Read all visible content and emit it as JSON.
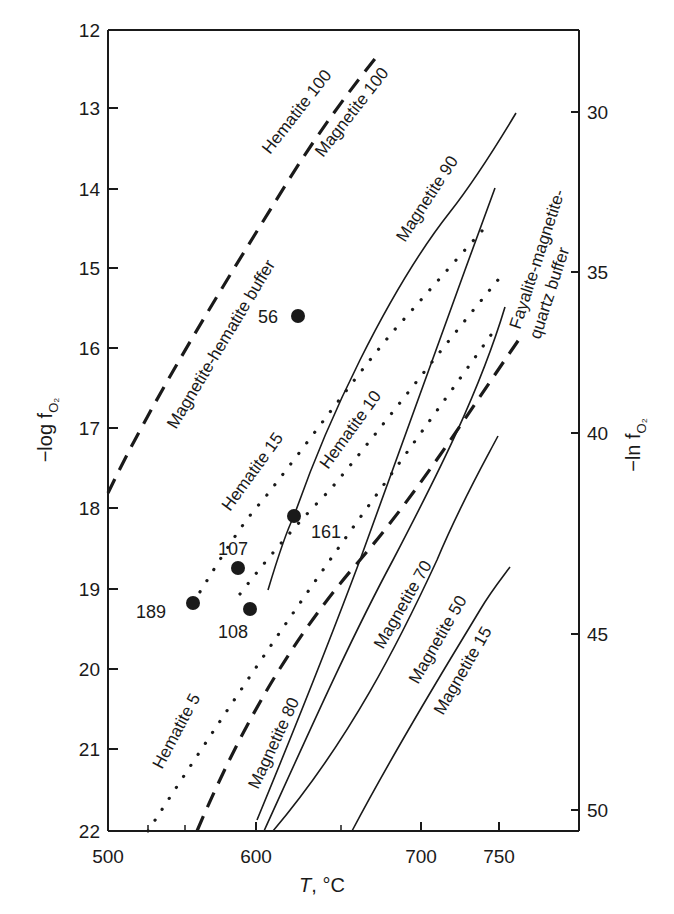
{
  "chart_data": {
    "type": "line",
    "title": "",
    "xlabel": "T, °C",
    "ylabel": "−log fO2",
    "ylabel_right": "−ln fO2",
    "xlim": [
      500,
      800
    ],
    "ylim": [
      22,
      12
    ],
    "x_ticks": [
      500,
      600,
      700,
      750
    ],
    "y_ticks": [
      12,
      13,
      14,
      15,
      16,
      17,
      18,
      19,
      20,
      21,
      22
    ],
    "y_right_ticks": [
      30,
      35,
      40,
      45,
      50
    ],
    "grid": false,
    "legend": "none (curves labelled inline)",
    "series": [
      {
        "name": "Magnetite-hematite buffer",
        "style": "dashed",
        "x": [
          500,
          530,
          570,
          610,
          660
        ],
        "y": [
          17.8,
          16.6,
          15.3,
          13.8,
          12.3
        ]
      },
      {
        "name": "Hematite 100 / Magnetite 100",
        "style": "label",
        "note": "labels on either side of magnetite-hematite buffer"
      },
      {
        "name": "Fayalite-magnetite-quartz buffer",
        "style": "dashed",
        "x": [
          565,
          620,
          680,
          758
        ],
        "y": [
          22.0,
          19.6,
          17.8,
          16.0
        ]
      },
      {
        "name": "Hematite 5",
        "style": "dotted",
        "x": [
          530,
          625,
          715,
          750
        ],
        "y": [
          22.0,
          19.2,
          16.7,
          15.7
        ]
      },
      {
        "name": "Hematite 10",
        "style": "dotted",
        "x": [
          595,
          650,
          715,
          750
        ],
        "y": [
          19.1,
          17.7,
          16.0,
          15.1
        ]
      },
      {
        "name": "Hematite 15",
        "style": "dotted",
        "x": [
          553,
          600,
          690,
          745
        ],
        "y": [
          19.2,
          17.9,
          15.5,
          14.3
        ]
      },
      {
        "name": "Magnetite 90",
        "style": "solid",
        "x": [
          610,
          625,
          680,
          720,
          762
        ],
        "y": [
          19.0,
          18.1,
          15.8,
          14.4,
          13.0
        ]
      },
      {
        "name": "Magnetite 80",
        "style": "solid",
        "x": [
          600,
          665,
          710,
          748
        ],
        "y": [
          21.9,
          18.7,
          16.8,
          14.0
        ]
      },
      {
        "name": "Magnetite 70",
        "style": "solid",
        "x": [
          605,
          685,
          755
        ],
        "y": [
          22.0,
          18.7,
          15.5
        ]
      },
      {
        "name": "Magnetite 50",
        "style": "solid",
        "x": [
          612,
          710,
          750
        ],
        "y": [
          22.0,
          18.7,
          17.1
        ]
      },
      {
        "name": "Magnetite 15",
        "style": "solid",
        "x": [
          655,
          745,
          757
        ],
        "y": [
          22.0,
          19.0,
          18.7
        ]
      }
    ],
    "points": [
      {
        "label": "56",
        "T": 640,
        "neg_log_fO2": 16.3
      },
      {
        "label": "161",
        "T": 625,
        "neg_log_fO2": 18.1
      },
      {
        "label": "107",
        "T": 588,
        "neg_log_fO2": 18.75
      },
      {
        "label": "189",
        "T": 556,
        "neg_log_fO2": 19.2
      },
      {
        "label": "108",
        "T": 596,
        "neg_log_fO2": 19.25
      }
    ]
  },
  "figure": {
    "plot": {
      "left": 108,
      "right": 579,
      "top": 30,
      "bottom": 831
    },
    "x_tick_px": [
      {
        "v": "500",
        "x": 108
      },
      {
        "v": "600",
        "x": 256
      },
      {
        "v": "700",
        "x": 421
      },
      {
        "v": "750",
        "x": 499
      }
    ],
    "x_minor_px": [
      148,
      185,
      341
    ],
    "y_tick_px": [
      {
        "v": "12",
        "y": 30
      },
      {
        "v": "13",
        "y": 108
      },
      {
        "v": "14",
        "y": 189
      },
      {
        "v": "15",
        "y": 268
      },
      {
        "v": "16",
        "y": 348
      },
      {
        "v": "17",
        "y": 428
      },
      {
        "v": "18",
        "y": 508
      },
      {
        "v": "19",
        "y": 589
      },
      {
        "v": "20",
        "y": 669
      },
      {
        "v": "21",
        "y": 749
      },
      {
        "v": "22",
        "y": 831
      }
    ],
    "yr_tick_px": [
      {
        "v": "30",
        "y": 112
      },
      {
        "v": "35",
        "y": 272
      },
      {
        "v": "40",
        "y": 433
      },
      {
        "v": "45",
        "y": 634
      },
      {
        "v": "50",
        "y": 810
      }
    ],
    "curves": [
      {
        "id": "mh-buffer",
        "style": "dashed",
        "d": "M108,493 C150,405 220,290 290,178 C320,130 350,90 378,55"
      },
      {
        "id": "fmq-buffer",
        "style": "dashed",
        "d": "M197,831 C240,730 290,640 360,560 C420,490 470,410 520,338"
      },
      {
        "id": "hem5",
        "style": "dotted",
        "d": "M148,831 C220,720 300,600 380,490 C430,420 470,365 498,325"
      },
      {
        "id": "hem10",
        "style": "dotted",
        "d": "M240,594 C270,555 300,520 330,490 C380,430 440,350 498,280"
      },
      {
        "id": "hem15",
        "style": "dotted",
        "d": "M193,603 C220,560 240,525 263,500 C310,440 360,370 397,327 C430,290 460,255 490,222"
      },
      {
        "id": "mag90",
        "style": "solid",
        "d": "M268,590 C280,550 287,530 294,516 C310,470 330,420 360,360 C390,300 420,250 450,212 C475,180 495,148 516,113"
      },
      {
        "id": "mag80",
        "style": "solid",
        "d": "M257,820 C290,740 330,640 360,560 C400,450 440,340 465,270 C478,235 487,210 495,188"
      },
      {
        "id": "mag70",
        "style": "solid",
        "d": "M264,831 C310,730 350,640 393,560 C440,470 480,390 505,307"
      },
      {
        "id": "mag50",
        "style": "solid",
        "d": "M273,831 C350,740 400,640 437,560 C460,505 480,470 498,436"
      },
      {
        "id": "mag15",
        "style": "solid",
        "d": "M352,831 C400,740 450,660 480,610 C492,590 502,578 510,567"
      }
    ],
    "points_px": [
      {
        "label": "56",
        "cx": 298,
        "cy": 316,
        "lx": 258,
        "ly": 323
      },
      {
        "label": "161",
        "cx": 294,
        "cy": 516,
        "lx": 311,
        "ly": 538
      },
      {
        "label": "107",
        "cx": 238,
        "cy": 568,
        "lx": 218,
        "ly": 555
      },
      {
        "label": "189",
        "cx": 193,
        "cy": 603,
        "lx": 136,
        "ly": 618
      },
      {
        "label": "108",
        "cx": 250,
        "cy": 609,
        "lx": 218,
        "ly": 638
      }
    ],
    "labels": [
      {
        "text": "Hematite 100",
        "x": 270,
        "y": 155,
        "rot": -52
      },
      {
        "text": "Magnetite 100",
        "x": 323,
        "y": 158,
        "rot": -52
      },
      {
        "text": "Magnetite-hematite buffer",
        "x": 176,
        "y": 430,
        "rot": -59
      },
      {
        "text": "Magnetite 90",
        "x": 405,
        "y": 243,
        "rot": -57
      },
      {
        "text": "Fayalite-magnetite-",
        "x": 520,
        "y": 330,
        "rot": -72
      },
      {
        "text": "quartz buffer",
        "x": 540,
        "y": 340,
        "rot": -72
      },
      {
        "text": "Hematite 15",
        "x": 230,
        "y": 512,
        "rot": -54
      },
      {
        "text": "Hematite 10",
        "x": 328,
        "y": 470,
        "rot": -54
      },
      {
        "text": "Hematite 5",
        "x": 162,
        "y": 770,
        "rot": -62
      },
      {
        "text": "Magnetite 80",
        "x": 258,
        "y": 790,
        "rot": -65
      },
      {
        "text": "Magnetite 70",
        "x": 383,
        "y": 650,
        "rot": -60
      },
      {
        "text": "Magnetite 50",
        "x": 418,
        "y": 685,
        "rot": -60
      },
      {
        "text": "Magnetite 15",
        "x": 443,
        "y": 716,
        "rot": -60
      }
    ],
    "axis_titles": {
      "left": {
        "text": "−log f",
        "sub": "O₂"
      },
      "right": {
        "text": "−ln f",
        "sub": "O₂"
      },
      "bottom": {
        "italic": "T",
        "rest": ", °C"
      }
    }
  }
}
